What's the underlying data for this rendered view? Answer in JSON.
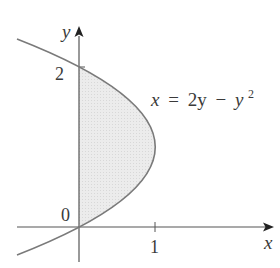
{
  "figure": {
    "type": "region between curve and y-axis",
    "equation": {
      "lhs": "x",
      "eq": "=",
      "term1": "2y",
      "minus": "−",
      "term2_base": "y",
      "term2_exp": "2",
      "full": "x = 2y − y²"
    },
    "axes": {
      "x_label": "x",
      "y_label": "y",
      "origin_label": "0",
      "x_ticks": [
        {
          "value": 1,
          "label": "1"
        }
      ],
      "y_ticks": [
        {
          "value": 2,
          "label": "2"
        }
      ]
    },
    "shaded_region": {
      "description": "Region bounded by x = 2y - y^2 and the y-axis, 0 <= y <= 2",
      "y_range": [
        0,
        2
      ]
    },
    "colors": {
      "curve": "#7a7a7a",
      "axis": "#555555",
      "fill": "#e6e6e6",
      "text": "#3a3a3a"
    }
  }
}
